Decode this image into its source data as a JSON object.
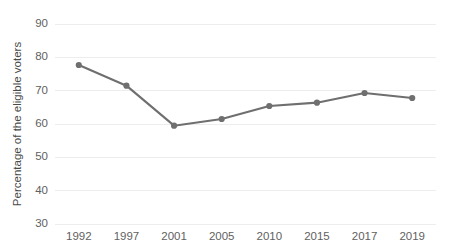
{
  "chart_data": {
    "type": "line",
    "title": "",
    "subtitle": "",
    "xlabel": "",
    "ylabel": "Percentage of the eligible voters",
    "categories": [
      "1992",
      "1997",
      "2001",
      "2005",
      "2010",
      "2015",
      "2017",
      "2019"
    ],
    "values": [
      77.7,
      71.5,
      59.5,
      61.5,
      65.4,
      66.4,
      69.3,
      67.8
    ],
    "series": [
      {
        "name": "Voter turnout",
        "values": [
          77.7,
          71.5,
          59.5,
          61.5,
          65.4,
          66.4,
          69.3,
          67.8
        ]
      }
    ],
    "ylim": [
      30,
      90
    ],
    "ytick_labels": [
      "90",
      "80",
      "70",
      "60",
      "50",
      "40",
      "30"
    ],
    "ytick_values": [
      90,
      80,
      70,
      60,
      50,
      40,
      30
    ],
    "grid": true,
    "grid_axis": "y",
    "legend": false,
    "legend_position": "none",
    "marker": "circle",
    "colors": {
      "line": "#6f6f6f",
      "marker": "#6f6f6f",
      "grid": "#ededed",
      "tick_text": "#5f5f5f",
      "axis_title": "#4a4a4a",
      "background": "#ffffff"
    }
  }
}
